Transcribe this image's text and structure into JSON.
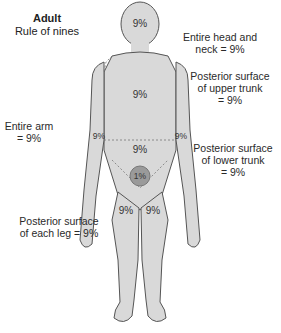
{
  "title": {
    "bold": "Adult",
    "subtitle": "Rule of nines"
  },
  "labels": {
    "head": [
      "Entire head and",
      "neck = 9%"
    ],
    "upper_trunk": [
      "Posterior surface",
      "of upper trunk",
      "= 9%"
    ],
    "arm": [
      "Entire arm",
      "= 9%"
    ],
    "lower_trunk": [
      "Posterior surface",
      "of lower trunk",
      "= 9%"
    ],
    "leg": [
      "Posterior surface",
      "of each leg = 9%"
    ]
  },
  "body_values": {
    "head": "9%",
    "upper_trunk": "9%",
    "lower_trunk": "9%",
    "left_arm": "9%",
    "right_arm": "9%",
    "perineum": "1%",
    "left_leg": "9%",
    "right_leg": "9%"
  },
  "colors": {
    "body_fill": "#d9d9d9",
    "outline": "#555555",
    "perineum": "#9a9a9a"
  }
}
